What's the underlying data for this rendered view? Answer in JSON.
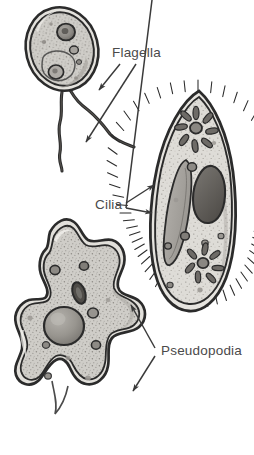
{
  "figure": {
    "background_color": "#ffffff",
    "ink_color": "#2b2b2b",
    "label_color": "#4a4a4a",
    "cell_fill_color": "#c9c7c2",
    "cell_fill_light": "#d8d6d1",
    "organelle_dark_color": "#6b6864",
    "organelle_mid_color": "#a6a39e"
  },
  "labels": [
    {
      "id": "flagella",
      "text": "Flagella",
      "x": 112,
      "y": 57,
      "pointer_count": 2,
      "target": "flagellate-tails"
    },
    {
      "id": "cilia",
      "text": "Cilia",
      "x": 95,
      "y": 209,
      "pointer_count": 2,
      "target": "paramecium-fringe"
    },
    {
      "id": "pseudopodia",
      "text": "Pseudopodia",
      "x": 161,
      "y": 355,
      "pointer_count": 2,
      "target": "amoeba-lobes"
    }
  ],
  "organisms": [
    {
      "id": "flagellate",
      "name": "flagellate",
      "locomotion": "flagella",
      "appendage_count": 2,
      "organelles": [
        "nucleus",
        "vacuole",
        "granules"
      ]
    },
    {
      "id": "paramecium",
      "name": "paramecium",
      "locomotion": "cilia",
      "organelles": [
        "macronucleus",
        "contractile-vacuole-upper",
        "contractile-vacuole-lower",
        "oral-groove",
        "food-vacuoles"
      ]
    },
    {
      "id": "amoeba",
      "name": "amoeba",
      "locomotion": "pseudopodia",
      "organelles": [
        "nucleus",
        "contractile-vacuole",
        "food-vacuoles"
      ]
    }
  ]
}
